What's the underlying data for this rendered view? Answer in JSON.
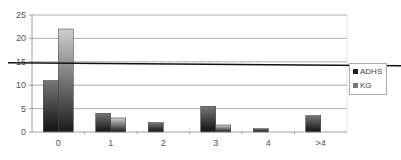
{
  "chart_data": {
    "type": "bar",
    "title": "",
    "xlabel": "",
    "ylabel": "",
    "categories": [
      "0",
      "1",
      "2",
      "3",
      "4",
      ">4"
    ],
    "series": [
      {
        "name": "ADHS",
        "values": [
          11,
          4,
          2,
          5.5,
          0.7,
          3.5
        ],
        "color": "#2a2a2a"
      },
      {
        "name": "KG",
        "values": [
          22,
          3,
          0,
          1.5,
          0,
          0
        ],
        "color": "#8a8a8a"
      }
    ],
    "ylim": [
      0,
      25
    ],
    "yticks": [
      0,
      5,
      10,
      15,
      20,
      25
    ],
    "grid": true,
    "reference_line": 15,
    "legend_position": "right"
  },
  "legend": {
    "items": [
      {
        "label": "ADHS"
      },
      {
        "label": "KG"
      }
    ]
  }
}
